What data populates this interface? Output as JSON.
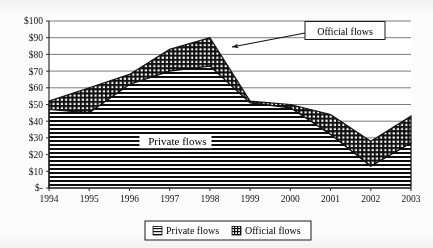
{
  "chart_data": {
    "type": "area",
    "stacked": true,
    "title": "",
    "subtitle": "",
    "xlabel": "",
    "ylabel": "",
    "categories": [
      "1994",
      "1995",
      "1996",
      "1997",
      "1998",
      "1999",
      "2000",
      "2001",
      "2002",
      "2003"
    ],
    "x_tick_labels": [
      "1994",
      "1995",
      "1996",
      "1997",
      "1998",
      "1999",
      "2000",
      "2001",
      "2002",
      "2003"
    ],
    "y_tick_labels": [
      "$-",
      "$10",
      "$20",
      "$30",
      "$40",
      "$50",
      "$60",
      "$70",
      "$80",
      "$90",
      "$100"
    ],
    "y_tick_values": [
      0,
      10,
      20,
      30,
      40,
      50,
      60,
      70,
      80,
      90,
      100
    ],
    "ylim": [
      0,
      100
    ],
    "grid": true,
    "grid_axis": "y",
    "legend_position": "bottom",
    "series": [
      {
        "name": "Private flows",
        "pattern": "horizontal-lines",
        "values": [
          47,
          45,
          62,
          70,
          73,
          51,
          48,
          32,
          13,
          27
        ]
      },
      {
        "name": "Official flows",
        "pattern": "cross-hatch",
        "values": [
          5,
          15,
          6,
          13,
          17,
          1,
          2,
          12,
          15,
          16
        ]
      }
    ],
    "stack_totals": [
      52,
      60,
      68,
      83,
      90,
      52,
      50,
      44,
      28,
      43
    ],
    "annotations": [
      {
        "name": "official-flows-callout",
        "text": "Official flows",
        "points_to_category": "1998",
        "points_to_value": 85
      },
      {
        "name": "private-flows-inline-label",
        "text": "Private flows",
        "at_category": "1996",
        "at_value": 28
      }
    ]
  },
  "legend": {
    "items": [
      {
        "label": "Private flows",
        "swatch": "horizontal-lines-swatch"
      },
      {
        "label": "Official flows",
        "swatch": "cross-hatch-swatch"
      }
    ]
  },
  "colors": {
    "background": "#ffffff",
    "axis": "#1a1a1a",
    "grid": "#5a5a5a",
    "series_fill": "#000000",
    "text": "#111111"
  }
}
